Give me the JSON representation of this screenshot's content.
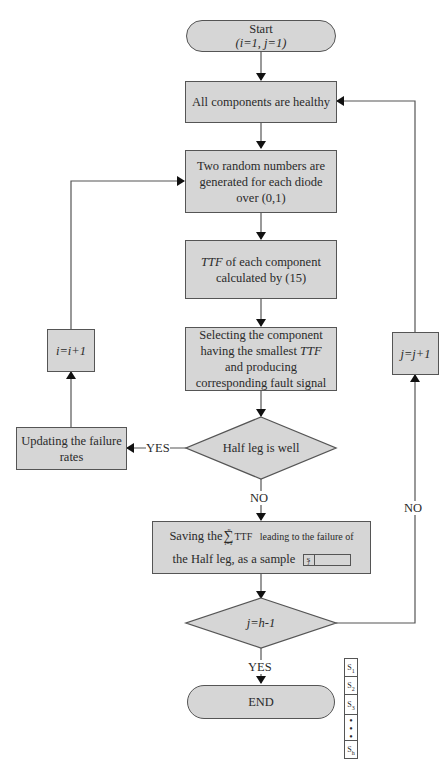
{
  "nodes": {
    "start": {
      "title": "Start",
      "init": "(i=1, j=1)"
    },
    "all_healthy": "All components are healthy",
    "random": "Two random numbers are generated for each diode over (0,1)",
    "ttf_prefix": "TTF",
    "ttf_rest": " of each component calculated by (15)",
    "select_1": "Selecting the component having the smallest ",
    "select_ttf": "TTF",
    "select_2": " and producing corresponding fault signal",
    "half_leg": "Half leg is well",
    "update": "Updating the failure rates",
    "i_inc": "i=i+1",
    "j_inc": "j=j+1",
    "save_1": "Saving the",
    "save_sigma_top": "n",
    "save_sigma_bot": "i=1",
    "save_2": "TTF   leading to the failure of",
    "save_3": "the Half leg, as a sample",
    "save_box": "S",
    "save_box_sub": "j",
    "j_check": "j=h-1",
    "end": "END"
  },
  "edge_labels": {
    "yes_left": "YES",
    "no_down": "NO",
    "no_right": "NO",
    "yes_down": "YES"
  },
  "samples": [
    {
      "s": "S",
      "sub": "1"
    },
    {
      "s": "S",
      "sub": "2"
    },
    {
      "s": "S",
      "sub": "3"
    },
    {
      "s": "•\n•\n•",
      "sub": ""
    },
    {
      "s": "S",
      "sub": "h"
    }
  ],
  "colors": {
    "fill": "#d6d6d6",
    "stroke": "#555555",
    "arrow": "#111111"
  }
}
